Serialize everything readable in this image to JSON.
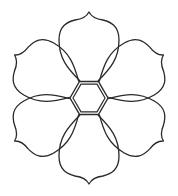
{
  "image": {
    "subject": "six-petal flower line drawing",
    "background_color": "#ffffff",
    "stroke_color": "#2a2a2a",
    "petal_count": 6,
    "center_shape": "hexagonal ring"
  }
}
